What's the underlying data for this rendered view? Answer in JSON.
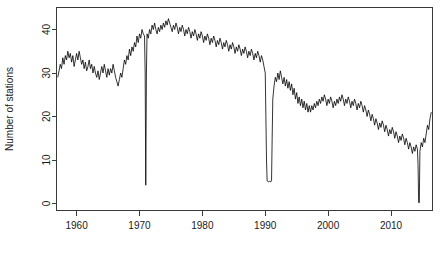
{
  "chart_data": {
    "type": "line",
    "title": "",
    "subtitle": "",
    "xlabel": "",
    "ylabel": "Number of stations",
    "xlim": [
      1956.8,
      2016.6
    ],
    "ylim": [
      0,
      43
    ],
    "grid": false,
    "legend": null,
    "xticks": [
      1960,
      1970,
      1980,
      1990,
      2000,
      2010
    ],
    "xtick_labels": [
      "1960",
      "1970",
      "1980",
      "1990",
      "2000",
      "2010"
    ],
    "yticks": [
      0,
      10,
      20,
      30,
      40
    ],
    "ytick_labels": [
      "0",
      "10",
      "20",
      "30",
      "40"
    ],
    "line_color": "#000000",
    "background_color": "#ffffff",
    "axis_color": "#3a3a3a",
    "annotations": [
      {
        "label": "dropout",
        "x": 1971.0,
        "y": 4
      },
      {
        "label": "dropout",
        "x": 1990.3,
        "y": 5
      },
      {
        "label": "dropout",
        "x": 2014.4,
        "y": 0
      }
    ],
    "series": [
      {
        "name": "Number of stations",
        "x": [
          1957.0,
          1957.2,
          1957.4,
          1957.6,
          1957.8,
          1958.0,
          1958.2,
          1958.4,
          1958.6,
          1958.8,
          1959.0,
          1959.2,
          1959.4,
          1959.6,
          1959.8,
          1960.0,
          1960.2,
          1960.4,
          1960.6,
          1960.8,
          1961.0,
          1961.2,
          1961.4,
          1961.6,
          1961.8,
          1962.0,
          1962.2,
          1962.4,
          1962.6,
          1962.8,
          1963.0,
          1963.2,
          1963.4,
          1963.6,
          1963.8,
          1964.0,
          1964.2,
          1964.4,
          1964.6,
          1964.8,
          1965.0,
          1965.2,
          1965.4,
          1965.6,
          1965.8,
          1966.0,
          1966.2,
          1966.4,
          1966.6,
          1966.8,
          1967.0,
          1967.2,
          1967.4,
          1967.6,
          1967.8,
          1968.0,
          1968.2,
          1968.4,
          1968.6,
          1968.8,
          1969.0,
          1969.2,
          1969.4,
          1969.6,
          1969.8,
          1970.0,
          1970.2,
          1970.4,
          1970.6,
          1970.8,
          1970.9,
          1971.0,
          1971.1,
          1971.2,
          1971.4,
          1971.6,
          1971.8,
          1972.0,
          1972.2,
          1972.4,
          1972.6,
          1972.8,
          1973.0,
          1973.2,
          1973.4,
          1973.6,
          1973.8,
          1974.0,
          1974.2,
          1974.4,
          1974.6,
          1974.8,
          1975.0,
          1975.2,
          1975.4,
          1975.6,
          1975.8,
          1976.0,
          1976.2,
          1976.4,
          1976.6,
          1976.8,
          1977.0,
          1977.2,
          1977.4,
          1977.6,
          1977.8,
          1978.0,
          1978.2,
          1978.4,
          1978.6,
          1978.8,
          1979.0,
          1979.2,
          1979.4,
          1979.6,
          1979.8,
          1980.0,
          1980.2,
          1980.4,
          1980.6,
          1980.8,
          1981.0,
          1981.2,
          1981.4,
          1981.6,
          1981.8,
          1982.0,
          1982.2,
          1982.4,
          1982.6,
          1982.8,
          1983.0,
          1983.2,
          1983.4,
          1983.6,
          1983.8,
          1984.0,
          1984.2,
          1984.4,
          1984.6,
          1984.8,
          1985.0,
          1985.2,
          1985.4,
          1985.6,
          1985.8,
          1986.0,
          1986.2,
          1986.4,
          1986.6,
          1986.8,
          1987.0,
          1987.2,
          1987.4,
          1987.6,
          1987.8,
          1988.0,
          1988.2,
          1988.4,
          1988.6,
          1988.8,
          1989.0,
          1989.2,
          1989.4,
          1989.6,
          1989.8,
          1990.0,
          1990.1,
          1990.2,
          1990.3,
          1990.5,
          1990.7,
          1990.9,
          1991.0,
          1991.1,
          1991.2,
          1991.4,
          1991.6,
          1991.8,
          1992.0,
          1992.2,
          1992.4,
          1992.6,
          1992.8,
          1993.0,
          1993.2,
          1993.4,
          1993.6,
          1993.8,
          1994.0,
          1994.2,
          1994.4,
          1994.6,
          1994.8,
          1995.0,
          1995.2,
          1995.4,
          1995.6,
          1995.8,
          1996.0,
          1996.2,
          1996.4,
          1996.6,
          1996.8,
          1997.0,
          1997.2,
          1997.4,
          1997.6,
          1997.8,
          1998.0,
          1998.2,
          1998.4,
          1998.6,
          1998.8,
          1999.0,
          1999.2,
          1999.4,
          1999.6,
          1999.8,
          2000.0,
          2000.2,
          2000.4,
          2000.6,
          2000.8,
          2001.0,
          2001.2,
          2001.4,
          2001.6,
          2001.8,
          2002.0,
          2002.2,
          2002.4,
          2002.6,
          2002.8,
          2003.0,
          2003.2,
          2003.4,
          2003.6,
          2003.8,
          2004.0,
          2004.2,
          2004.4,
          2004.6,
          2004.8,
          2005.0,
          2005.2,
          2005.4,
          2005.6,
          2005.8,
          2006.0,
          2006.2,
          2006.4,
          2006.6,
          2006.8,
          2007.0,
          2007.2,
          2007.4,
          2007.6,
          2007.8,
          2008.0,
          2008.2,
          2008.4,
          2008.6,
          2008.8,
          2009.0,
          2009.2,
          2009.4,
          2009.6,
          2009.8,
          2010.0,
          2010.2,
          2010.4,
          2010.6,
          2010.8,
          2011.0,
          2011.2,
          2011.4,
          2011.6,
          2011.8,
          2012.0,
          2012.2,
          2012.4,
          2012.6,
          2012.8,
          2013.0,
          2013.2,
          2013.4,
          2013.6,
          2013.8,
          2014.0,
          2014.2,
          2014.3,
          2014.4,
          2014.5,
          2014.6,
          2014.8,
          2015.0,
          2015.2,
          2015.4,
          2015.6,
          2015.8,
          2016.0,
          2016.2,
          2016.4
        ],
        "y": [
          29.0,
          30.5,
          32.0,
          31.0,
          33.5,
          32.0,
          34.0,
          33.0,
          35.0,
          33.5,
          34.5,
          32.5,
          34.0,
          31.5,
          33.0,
          34.5,
          33.0,
          35.0,
          33.5,
          32.0,
          33.0,
          31.0,
          32.5,
          30.5,
          31.5,
          33.0,
          31.0,
          32.0,
          30.0,
          31.5,
          30.0,
          29.0,
          30.5,
          28.5,
          30.0,
          31.5,
          30.0,
          32.0,
          30.5,
          29.0,
          31.0,
          29.5,
          31.0,
          30.0,
          32.0,
          30.5,
          29.0,
          28.0,
          27.0,
          28.5,
          30.0,
          29.0,
          31.0,
          33.0,
          32.0,
          34.0,
          33.0,
          35.5,
          34.0,
          36.0,
          35.0,
          37.0,
          36.0,
          38.5,
          37.0,
          39.0,
          38.0,
          40.0,
          39.0,
          38.5,
          30.0,
          4.2,
          30.0,
          39.0,
          38.0,
          40.0,
          39.0,
          41.0,
          40.0,
          41.5,
          40.0,
          39.0,
          40.5,
          39.5,
          41.0,
          40.0,
          41.5,
          40.5,
          42.0,
          41.0,
          42.5,
          41.5,
          40.5,
          39.5,
          41.0,
          40.0,
          41.5,
          40.5,
          39.0,
          40.5,
          39.5,
          41.0,
          40.0,
          38.5,
          40.0,
          39.0,
          40.5,
          39.5,
          38.0,
          39.5,
          38.5,
          40.0,
          39.0,
          37.5,
          39.0,
          38.0,
          39.5,
          38.5,
          37.0,
          38.5,
          37.5,
          39.0,
          38.0,
          36.5,
          38.0,
          37.0,
          38.5,
          37.5,
          36.0,
          37.5,
          36.5,
          38.0,
          37.0,
          35.5,
          37.0,
          36.0,
          37.5,
          36.5,
          35.0,
          36.5,
          35.5,
          37.0,
          36.0,
          34.5,
          36.0,
          35.0,
          36.5,
          35.5,
          34.0,
          35.5,
          34.5,
          36.0,
          35.0,
          33.5,
          35.0,
          34.0,
          35.5,
          34.5,
          33.0,
          34.5,
          33.5,
          35.0,
          34.0,
          32.5,
          34.0,
          33.0,
          31.5,
          30.0,
          20.0,
          10.0,
          5.2,
          5.0,
          5.1,
          5.0,
          5.2,
          15.0,
          24.0,
          27.0,
          29.0,
          28.0,
          30.0,
          28.5,
          30.5,
          29.0,
          27.5,
          29.0,
          27.0,
          28.5,
          26.5,
          28.0,
          26.0,
          27.5,
          25.0,
          26.5,
          24.0,
          25.5,
          23.0,
          24.5,
          22.5,
          24.0,
          22.0,
          23.5,
          21.5,
          23.0,
          21.0,
          22.5,
          21.0,
          22.5,
          21.5,
          23.0,
          22.0,
          23.5,
          22.5,
          24.0,
          23.0,
          24.5,
          23.5,
          25.0,
          24.0,
          22.5,
          24.0,
          23.0,
          24.5,
          23.5,
          22.0,
          23.5,
          22.5,
          24.0,
          23.0,
          24.5,
          23.5,
          25.0,
          24.0,
          22.5,
          24.0,
          23.0,
          24.5,
          23.5,
          22.0,
          23.5,
          22.5,
          24.0,
          23.0,
          21.5,
          23.0,
          22.0,
          23.5,
          22.5,
          21.0,
          22.5,
          21.5,
          20.0,
          21.5,
          20.5,
          19.0,
          20.5,
          19.5,
          18.0,
          19.5,
          18.5,
          17.0,
          18.5,
          17.5,
          19.0,
          18.0,
          16.5,
          18.0,
          17.0,
          15.5,
          17.0,
          16.0,
          17.5,
          16.5,
          15.0,
          16.5,
          15.5,
          14.0,
          15.5,
          14.5,
          16.0,
          15.0,
          13.5,
          15.0,
          14.0,
          12.5,
          14.0,
          13.0,
          11.5,
          13.0,
          12.0,
          13.5,
          12.5,
          9.0,
          0.2,
          0.2,
          12.0,
          14.0,
          13.0,
          15.0,
          14.0,
          16.0,
          18.0,
          17.0,
          19.5,
          21.0
        ]
      }
    ]
  }
}
